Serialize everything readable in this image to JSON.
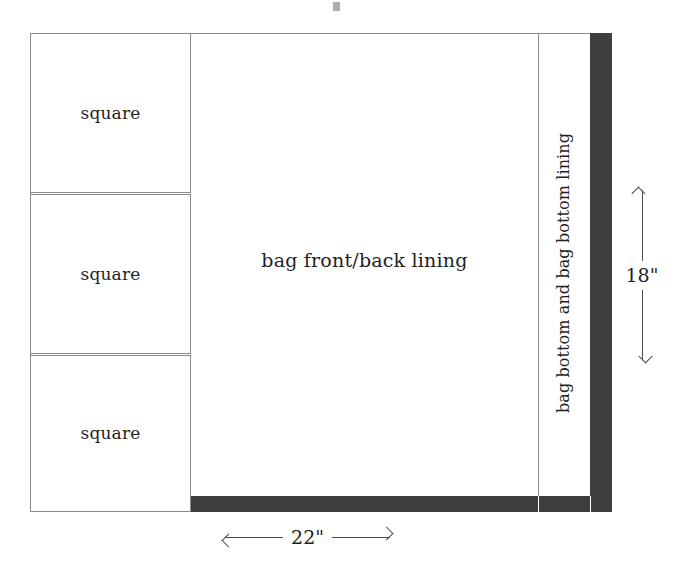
{
  "diagram": {
    "colors": {
      "outline": "#8a8a8a",
      "fabric_dark": "#3e3e3e",
      "background": "#ffffff",
      "text": "#1f1f1f",
      "dimension_line": "#4a4a4a"
    },
    "pieces": {
      "squares": [
        {
          "label": "square"
        },
        {
          "label": "square"
        },
        {
          "label": "square"
        }
      ],
      "center_panel": {
        "label": "bag front/back lining"
      },
      "right_strip": {
        "label": "bag bottom and bag bottom lining"
      },
      "dark_bar": {
        "label": "bag bottom"
      }
    },
    "dimensions": {
      "width": {
        "value": "22\"",
        "orientation": "horizontal",
        "arrow_left": "left-arrow-icon",
        "arrow_right": "right-arrow-icon"
      },
      "height": {
        "value": "18\"",
        "orientation": "vertical",
        "arrow_up": "up-arrow-icon",
        "arrow_down": "down-arrow-icon"
      }
    }
  }
}
